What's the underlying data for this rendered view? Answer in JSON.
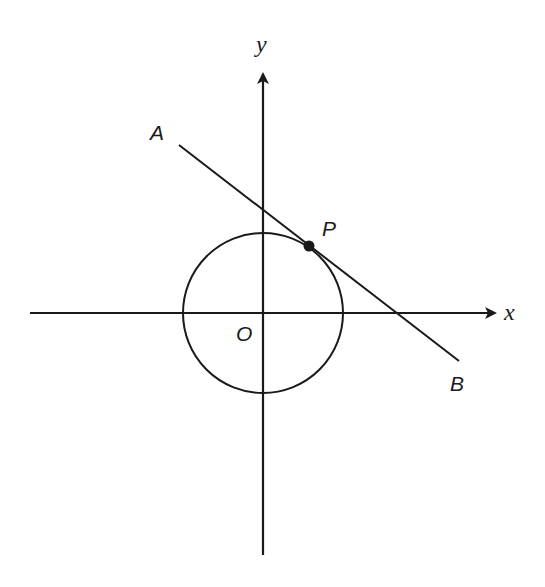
{
  "diagram": {
    "axes": {
      "x_label": "x",
      "y_label": "y"
    },
    "labels": {
      "origin": "O",
      "point_a": "A",
      "point_b": "B",
      "tangent_point": "P"
    },
    "colors": {
      "stroke": "#1a1a1a",
      "background": "#ffffff"
    }
  }
}
